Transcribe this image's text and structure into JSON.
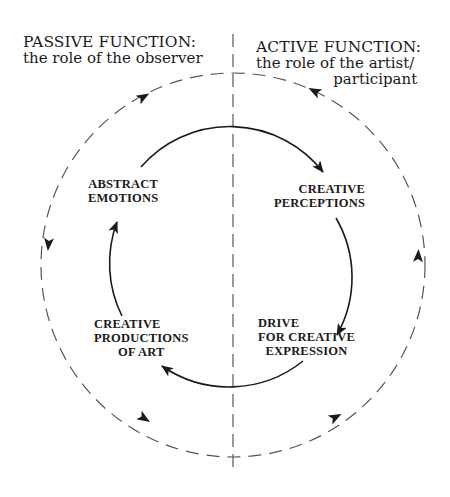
{
  "diagram": {
    "type": "cycle",
    "colors": {
      "line": "#1a1a1a",
      "dashed": "#555555",
      "background": "#ffffff"
    },
    "left_heading": {
      "title": "PASSIVE FUNCTION:",
      "subtitle": "the role of the observer"
    },
    "right_heading": {
      "title": "ACTIVE FUNCTION:",
      "subtitle_line1": "the role of the artist/",
      "subtitle_line2": "participant"
    },
    "inner_cycle": {
      "direction": "clockwise",
      "nodes": [
        {
          "id": "abstract-emotions",
          "lines": [
            "ABSTRACT",
            "EMOTIONS"
          ]
        },
        {
          "id": "creative-perceptions",
          "lines": [
            "CREATIVE",
            "PERCEPTIONS"
          ]
        },
        {
          "id": "drive-for-creative-expression",
          "lines": [
            "DRIVE",
            "FOR CREATIVE",
            "EXPRESSION"
          ]
        },
        {
          "id": "creative-productions-of-art",
          "lines": [
            "CREATIVE",
            "PRODUCTIONS",
            "OF ART"
          ]
        }
      ],
      "edges": [
        {
          "from": "abstract-emotions",
          "to": "creative-perceptions"
        },
        {
          "from": "creative-perceptions",
          "to": "drive-for-creative-expression"
        },
        {
          "from": "drive-for-creative-expression",
          "to": "creative-productions-of-art"
        },
        {
          "from": "creative-productions-of-art",
          "to": "abstract-emotions"
        }
      ]
    },
    "outer_cycle": {
      "style": "dashed",
      "direction": "counter-clockwise",
      "arrow_count": 6
    },
    "divider": {
      "style": "dashed",
      "orientation": "vertical"
    }
  }
}
